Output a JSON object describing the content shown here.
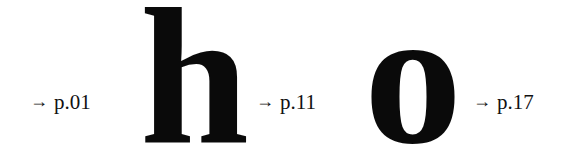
{
  "entries": [
    {
      "arrow": "→",
      "page": "p.01"
    },
    {
      "letter": "h"
    },
    {
      "arrow": "→",
      "page": "p.11"
    },
    {
      "letter": "o"
    },
    {
      "arrow": "→",
      "page": "p.17"
    }
  ]
}
